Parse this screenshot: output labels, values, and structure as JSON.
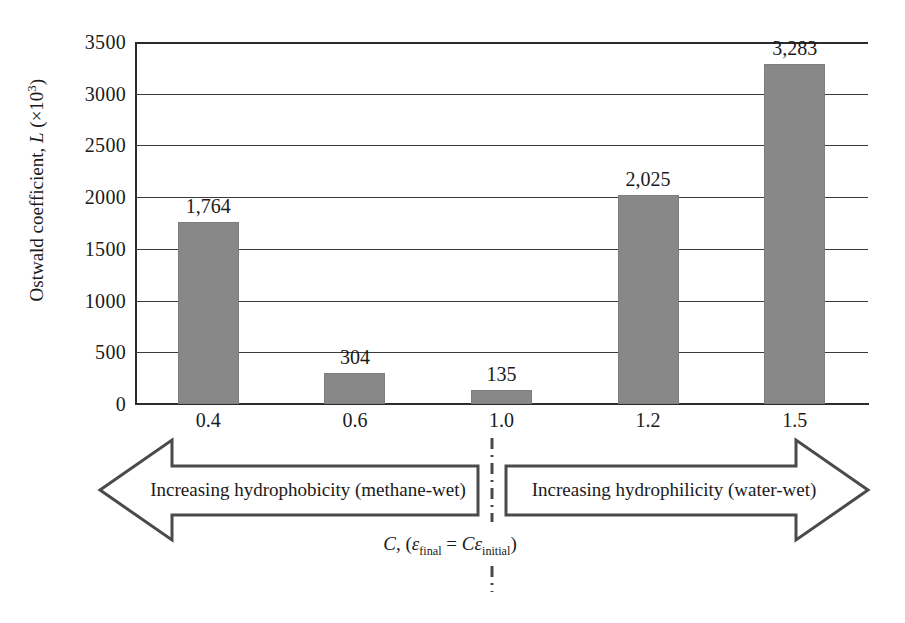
{
  "chart_data": {
    "type": "bar",
    "title": "",
    "xlabel": "C, (εfinal = Cεinitial)",
    "ylabel": "Ostwald coefficient, L (×10³)",
    "categories": [
      "0.4",
      "0.6",
      "1.0",
      "1.2",
      "1.5"
    ],
    "values": [
      1764,
      304,
      135,
      2025,
      3283
    ],
    "value_labels": [
      "1,764",
      "304",
      "135",
      "2,025",
      "3,283"
    ],
    "ylim": [
      0,
      3500
    ],
    "ytick_values": [
      0,
      500,
      1000,
      1500,
      2000,
      2500,
      3000,
      3500
    ],
    "ytick_labels": [
      "0",
      "500",
      "1000",
      "1500",
      "2000",
      "2500",
      "3000",
      "3500"
    ],
    "grid": "horizontal",
    "legend": "none",
    "bar_color": "#888888",
    "axis_color": "#2b2b2b",
    "annotations": [
      "Increasing hydrophobicity (methane-wet)",
      "Increasing hydrophilicity (water-wet)"
    ]
  },
  "axis": {
    "y_title_text": "Ostwald coefficient, ",
    "y_title_symbol": "L",
    "y_title_unit_open": " (×10",
    "y_title_unit_exp": "3",
    "y_title_unit_close": ")"
  },
  "annotations": {
    "left_arrow_label": "Increasing hydrophobicity (methane-wet)",
    "right_arrow_label": "Increasing hydrophilicity (water-wet)",
    "caption": {
      "variable": "C",
      "comma_open": ", (",
      "eps1": "ε",
      "sub1": "final",
      "equals": " = ",
      "coef": "C",
      "eps2": "ε",
      "sub2": "initial",
      "close": ")"
    }
  }
}
